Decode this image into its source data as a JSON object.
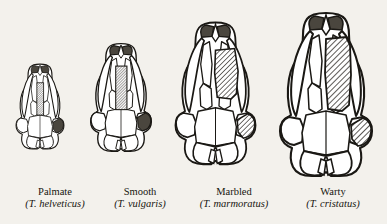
{
  "figure": {
    "type": "scientific-illustration",
    "background_color": "#f3f1ec",
    "ink_color": "#1a1814",
    "shading": {
      "hatch_color": "#2a2722",
      "dark_fill": "#4a463e",
      "bone_fill": "#ffffff"
    },
    "arrangement": "four skulls left to right in order of increasing size, baseline aligned, captions beneath each"
  },
  "specimens": [
    {
      "id": "palmate",
      "common_name": "Palmate",
      "species_name": "(T. helveticus)",
      "relative_size": 0.52,
      "left": 8,
      "width": 94,
      "skull_left": 14,
      "skull_bottom": 40,
      "caption_top": 186,
      "squamosal_shading": "dark",
      "vomer_hatch": "narrow"
    },
    {
      "id": "smooth",
      "common_name": "Smooth",
      "species_name": "(T. vulgaris)",
      "relative_size": 0.66,
      "left": 93,
      "width": 94,
      "skull_left": 88,
      "skull_bottom": 40,
      "caption_top": 186,
      "squamosal_shading": "dark",
      "vomer_hatch": "medium"
    },
    {
      "id": "marbled",
      "common_name": "Marbled",
      "species_name": "(T. marmoratus)",
      "relative_size": 0.87,
      "left": 178,
      "width": 112,
      "skull_left": 172,
      "skull_bottom": 40,
      "caption_top": 186,
      "squamosal_shading": "hatched",
      "vomer_hatch": "broad"
    },
    {
      "id": "warty",
      "common_name": "Warty",
      "species_name": "(T. cristatus)",
      "relative_size": 1.0,
      "left": 283,
      "width": 100,
      "skull_left": 276,
      "skull_bottom": 40,
      "caption_top": 186,
      "squamosal_shading": "hatched",
      "vomer_hatch": "broad-long"
    }
  ]
}
